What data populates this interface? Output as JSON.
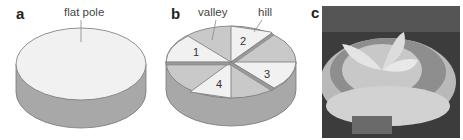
{
  "panels": {
    "a": {
      "label": "a",
      "annotation": "flat pole"
    },
    "b": {
      "label": "b",
      "annotations": {
        "valley": "valley",
        "hill": "hill"
      },
      "sectors": [
        "1",
        "2",
        "3",
        "4"
      ]
    },
    "c": {
      "label": "c",
      "content": "photograph of cyclotron magnet with spiral sectors"
    }
  },
  "colors": {
    "top_light": "#f1f1f1",
    "valley_gray": "#c9c9c9",
    "side_gray": "#a8a8a8",
    "outline": "#777777"
  }
}
